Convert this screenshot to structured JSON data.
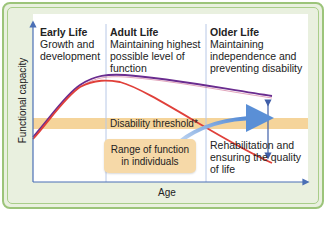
{
  "diagram": {
    "type": "life-course-functional-capacity",
    "y_axis_label": "Functional capacity",
    "x_axis_label": "Age",
    "stages": [
      {
        "heading": "Early Life",
        "lines": [
          "Growth and",
          "development"
        ]
      },
      {
        "heading": "Adult Life",
        "lines": [
          "Maintaining highest",
          "possible level of",
          "function"
        ]
      },
      {
        "heading": "Older Life",
        "lines": [
          "Maintaining",
          "independence and",
          "preventing disability"
        ]
      }
    ],
    "threshold_label": "Disability threshold*",
    "range_box": {
      "lines": [
        "Range of function",
        "in individuals"
      ]
    },
    "rehab_label": [
      "Rehabilitation and",
      "ensuring the quality",
      "of life"
    ],
    "colors": {
      "frame_border": "#9cc47a",
      "frame_fill": "#e9f0df",
      "axis": "#4a6fb5",
      "divider": "#b8c8e6",
      "threshold_band": "#f5d49a",
      "range_box": "#f6d9a8",
      "upper_curve": "#6a2c8f",
      "lower_curve": "#e0403a",
      "arrow": "#5a8fd6"
    }
  }
}
